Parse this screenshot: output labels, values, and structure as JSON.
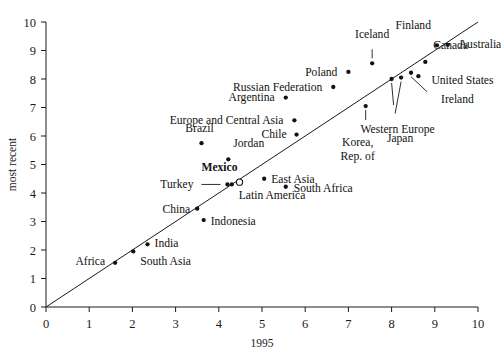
{
  "chart_data": {
    "type": "scatter",
    "title": "",
    "xlabel": "1995",
    "ylabel": "most recent",
    "xlim": [
      0,
      10
    ],
    "ylim": [
      0,
      10
    ],
    "xticks": [
      0,
      1,
      2,
      3,
      4,
      5,
      6,
      7,
      8,
      9,
      10
    ],
    "yticks": [
      0,
      1,
      2,
      3,
      4,
      5,
      6,
      7,
      8,
      9,
      10
    ],
    "grid": false,
    "legend": "none",
    "annotations": [
      {
        "name": "reference-line",
        "kind": "identity-line",
        "from": [
          0,
          0
        ],
        "to": [
          10,
          10
        ],
        "note": "45-degree y = x diagonal"
      }
    ],
    "points": [
      {
        "label": "Africa",
        "x": 1.6,
        "y": 1.55,
        "marker": "filled",
        "label_pos": "left"
      },
      {
        "label": "South Asia",
        "x": 2.02,
        "y": 1.95,
        "marker": "filled",
        "label_pos": "below-right"
      },
      {
        "label": "India",
        "x": 2.35,
        "y": 2.2,
        "marker": "filled",
        "label_pos": "right"
      },
      {
        "label": "Indonesia",
        "x": 3.65,
        "y": 3.05,
        "marker": "filled",
        "label_pos": "right"
      },
      {
        "label": "China",
        "x": 3.5,
        "y": 3.45,
        "marker": "filled",
        "label_pos": "left"
      },
      {
        "label": "Turkey",
        "x": 4.2,
        "y": 4.3,
        "marker": "filled",
        "label_pos": "leader-left"
      },
      {
        "label": "Latin America",
        "x": 4.3,
        "y": 4.3,
        "marker": "filled",
        "label_pos": "below-right"
      },
      {
        "label": "Mexico",
        "x": 4.48,
        "y": 4.38,
        "marker": "open",
        "label_pos": "above-left"
      },
      {
        "label": "East Asia",
        "x": 5.05,
        "y": 4.5,
        "marker": "filled",
        "label_pos": "right"
      },
      {
        "label": "South Africa",
        "x": 5.55,
        "y": 4.22,
        "marker": "filled",
        "label_pos": "right"
      },
      {
        "label": "Jordan",
        "x": 4.22,
        "y": 5.18,
        "marker": "filled",
        "label_pos": "above-right"
      },
      {
        "label": "Brazil",
        "x": 3.6,
        "y": 5.75,
        "marker": "filled",
        "label_pos": "above"
      },
      {
        "label": "Chile",
        "x": 5.8,
        "y": 6.05,
        "marker": "filled",
        "label_pos": "left"
      },
      {
        "label": "Europe and Central Asia",
        "x": 5.75,
        "y": 6.55,
        "marker": "filled",
        "label_pos": "left"
      },
      {
        "label": "Argentina",
        "x": 5.55,
        "y": 7.35,
        "marker": "filled",
        "label_pos": "left"
      },
      {
        "label": "Russian Federation",
        "x": 6.65,
        "y": 7.72,
        "marker": "filled",
        "label_pos": "left"
      },
      {
        "label": "Poland",
        "x": 7.0,
        "y": 8.25,
        "marker": "filled",
        "label_pos": "left"
      },
      {
        "label": "Iceland",
        "x": 7.55,
        "y": 8.55,
        "marker": "filled",
        "label_pos": "leader-above"
      },
      {
        "label": "Korea, Rep. of",
        "x": 7.4,
        "y": 7.05,
        "marker": "filled",
        "label_pos": "leader-below"
      },
      {
        "label": "Western Europe",
        "x": 8.0,
        "y": 8.0,
        "marker": "filled",
        "label_pos": "leader-below"
      },
      {
        "label": "Japan",
        "x": 8.22,
        "y": 8.05,
        "marker": "filled",
        "label_pos": "leader-below"
      },
      {
        "label": "Ireland",
        "x": 8.45,
        "y": 8.22,
        "marker": "filled",
        "label_pos": "leader-below-right"
      },
      {
        "label": "United States",
        "x": 8.62,
        "y": 8.1,
        "marker": "filled",
        "label_pos": "right"
      },
      {
        "label": "Canada",
        "x": 8.78,
        "y": 8.6,
        "marker": "filled",
        "label_pos": "above-right"
      },
      {
        "label": "Finland",
        "x": 9.05,
        "y": 9.18,
        "marker": "filled",
        "label_pos": "above-left"
      },
      {
        "label": "Australia",
        "x": 9.3,
        "y": 9.2,
        "marker": "filled",
        "label_pos": "right"
      }
    ]
  },
  "axes": {
    "x_axis_label": "1995",
    "y_axis_label": "most recent",
    "x_tick_labels": [
      "0",
      "1",
      "2",
      "3",
      "4",
      "5",
      "6",
      "7",
      "8",
      "9",
      "10"
    ],
    "y_tick_labels": [
      "0",
      "1",
      "2",
      "3",
      "4",
      "5",
      "6",
      "7",
      "8",
      "9",
      "10"
    ]
  },
  "colors": {
    "ink": "#111111",
    "axis": "#1a1a1a",
    "background": "#ffffff"
  }
}
